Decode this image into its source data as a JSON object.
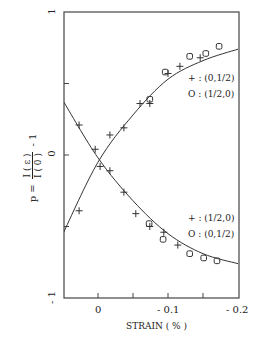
{
  "chart_data": {
    "type": "scatter",
    "title": "",
    "xlabel": "STRAIN ( % )",
    "ylabel": "p = I(ε)/I(0) - 1",
    "ylabel_parts": {
      "lhs": "p =",
      "num": "I ( ε )",
      "den": "I ( 0 )",
      "rhs": "- 1"
    },
    "x_ticks": [
      {
        "value": 0,
        "label": "0"
      },
      {
        "value": -0.1,
        "label": "- 0.1"
      },
      {
        "value": -0.2,
        "label": "- 0.2"
      }
    ],
    "y_ticks": [
      {
        "value": 1,
        "label": "1"
      },
      {
        "value": 0,
        "label": "0"
      },
      {
        "value": -1,
        "label": "- 1"
      }
    ],
    "xlim": [
      0.05,
      -0.2
    ],
    "ylim": [
      -1,
      1
    ],
    "grid": false,
    "legend_upper": [
      {
        "marker": "+",
        "text": "+ : (0,1/2)"
      },
      {
        "marker": "o",
        "text": "O : (1/2,0)"
      }
    ],
    "legend_lower": [
      {
        "marker": "+",
        "text": "+ : (1/2,0)"
      },
      {
        "marker": "o",
        "text": "O : (0,1/2)"
      }
    ],
    "series": [
      {
        "name": "(0,1/2) plus - rising",
        "marker": "+",
        "x": [
          0.027,
          -0.003,
          -0.017,
          -0.037,
          -0.06,
          -0.074,
          -0.1,
          -0.117,
          -0.146
        ],
        "y": [
          -0.39,
          -0.08,
          0.14,
          0.19,
          0.36,
          0.36,
          0.57,
          0.62,
          0.68
        ]
      },
      {
        "name": "(1/2,0) open - rising",
        "marker": "o",
        "x": [
          -0.074,
          -0.096,
          -0.131,
          -0.154,
          -0.173
        ],
        "y": [
          0.39,
          0.58,
          0.69,
          0.71,
          0.76
        ]
      },
      {
        "name": "(1/2,0) plus - falling",
        "marker": "+",
        "x": [
          0.027,
          0.004,
          -0.017,
          -0.037,
          -0.054,
          -0.074,
          -0.094,
          -0.114
        ],
        "y": [
          0.21,
          0.04,
          -0.11,
          -0.26,
          -0.41,
          -0.5,
          -0.54,
          -0.63
        ]
      },
      {
        "name": "(0,1/2) open - falling",
        "marker": "o",
        "x": [
          -0.073,
          -0.093,
          -0.131,
          -0.151,
          -0.17
        ],
        "y": [
          -0.48,
          -0.59,
          -0.69,
          -0.72,
          -0.74
        ]
      }
    ],
    "curves": [
      {
        "name": "fit rising",
        "x": [
          0.05,
          0.0,
          -0.05,
          -0.1,
          -0.15,
          -0.2
        ],
        "y": [
          -0.55,
          -0.05,
          0.28,
          0.53,
          0.66,
          0.74
        ]
      },
      {
        "name": "fit falling",
        "x": [
          0.05,
          0.0,
          -0.05,
          -0.1,
          -0.15,
          -0.2
        ],
        "y": [
          0.38,
          -0.02,
          -0.32,
          -0.55,
          -0.69,
          -0.76
        ]
      }
    ]
  }
}
